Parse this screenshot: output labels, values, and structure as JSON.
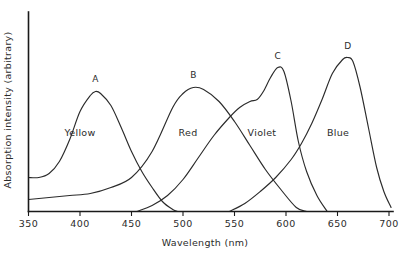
{
  "chart_data": {
    "type": "line",
    "title": "",
    "xlabel": "Wavelength (nm)",
    "ylabel": "Absorption intensity (arbitrary)",
    "xlim": [
      350,
      700
    ],
    "ylim": [
      0,
      1
    ],
    "grid": false,
    "legend": "none",
    "xticks": [
      "350",
      "400",
      "450",
      "500",
      "550",
      "600",
      "650",
      "700"
    ],
    "xtick_values": [
      350,
      400,
      450,
      500,
      550,
      600,
      650,
      700
    ],
    "yticks": [],
    "series": [
      {
        "name": "A",
        "label": "A",
        "band_label": "Yellow",
        "peak_nm": 415,
        "peak_value": 0.6,
        "points_x": [
          350,
          360,
          370,
          380,
          390,
          400,
          410,
          415,
          420,
          430,
          440,
          450,
          460,
          470,
          480,
          490,
          495
        ],
        "points_y": [
          0.17,
          0.17,
          0.19,
          0.25,
          0.36,
          0.5,
          0.58,
          0.6,
          0.59,
          0.53,
          0.42,
          0.3,
          0.2,
          0.12,
          0.05,
          0.01,
          0.0
        ]
      },
      {
        "name": "B",
        "label": "B",
        "band_label": "Red",
        "peak_nm": 510,
        "peak_value": 0.62,
        "points_x": [
          350,
          370,
          390,
          410,
          430,
          450,
          470,
          490,
          500,
          510,
          520,
          535,
          550,
          565,
          580,
          595,
          610,
          620
        ],
        "points_y": [
          0.06,
          0.07,
          0.08,
          0.09,
          0.12,
          0.17,
          0.3,
          0.52,
          0.59,
          0.62,
          0.61,
          0.55,
          0.45,
          0.33,
          0.21,
          0.11,
          0.02,
          0.0
        ]
      },
      {
        "name": "C",
        "label": "C",
        "band_label": "Violet",
        "peak_nm": 592,
        "peak_value": 0.72,
        "points_x": [
          455,
          470,
          485,
          500,
          515,
          530,
          545,
          555,
          565,
          572,
          578,
          585,
          592,
          598,
          605,
          612,
          620,
          630,
          640
        ],
        "points_y": [
          0.0,
          0.03,
          0.08,
          0.16,
          0.27,
          0.38,
          0.47,
          0.52,
          0.55,
          0.56,
          0.6,
          0.67,
          0.72,
          0.7,
          0.55,
          0.35,
          0.2,
          0.08,
          0.0
        ]
      },
      {
        "name": "D",
        "label": "D",
        "band_label": "Blue",
        "peak_nm": 660,
        "peak_value": 0.77,
        "points_x": [
          545,
          560,
          575,
          590,
          605,
          615,
          625,
          635,
          645,
          655,
          660,
          665,
          672,
          680,
          688,
          695,
          702
        ],
        "points_y": [
          0.0,
          0.04,
          0.1,
          0.17,
          0.26,
          0.34,
          0.44,
          0.56,
          0.69,
          0.76,
          0.77,
          0.75,
          0.62,
          0.42,
          0.22,
          0.1,
          0.02
        ]
      }
    ]
  }
}
